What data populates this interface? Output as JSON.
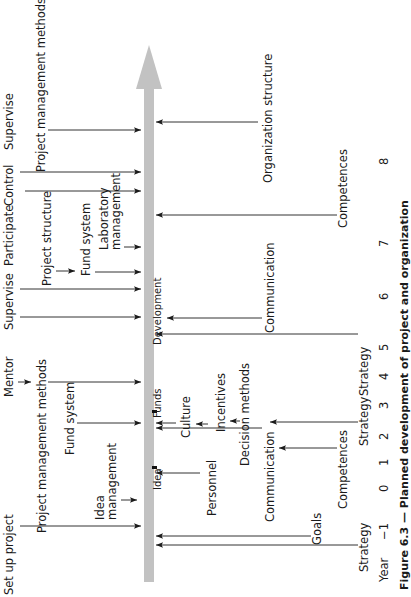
{
  "diagram": {
    "axis": {
      "label": "Year",
      "ticks": [
        "−1",
        "0",
        "1",
        "2",
        "3",
        "4",
        "5",
        "6",
        "7",
        "8"
      ],
      "tick_x": 378,
      "tick_y": [
        540,
        492,
        466,
        440,
        409,
        380,
        351,
        300,
        247,
        165
      ],
      "label_pos": {
        "x": 378,
        "y": 582
      }
    },
    "main_arrow": {
      "color": "#c2c2c2",
      "x": 144,
      "width": 10,
      "y_top": 45,
      "y_bottom": 582,
      "head_height": 44,
      "head_width": 26
    },
    "left_roles": [
      {
        "label": "Set up project",
        "x": 3,
        "y": 595
      },
      {
        "label": "Mentor",
        "x": 3,
        "y": 397
      },
      {
        "label": "Supervise",
        "x": 3,
        "y": 330
      },
      {
        "label": "Participate",
        "x": 3,
        "y": 266
      },
      {
        "label": "Control",
        "x": 3,
        "y": 206
      },
      {
        "label": "Supervise",
        "x": 3,
        "y": 150
      }
    ],
    "left_labels": [
      {
        "label": "Project management methods",
        "x": 36,
        "y": 533
      },
      {
        "label": "Fund system",
        "x": 64,
        "y": 455
      },
      {
        "label": "Idea",
        "x": 94,
        "y": 520,
        "line2": "management"
      },
      {
        "label": "Project structure",
        "x": 41,
        "y": 286
      },
      {
        "label": "Fund system",
        "x": 80,
        "y": 276
      },
      {
        "label": "Laboratory",
        "x": 98,
        "y": 250,
        "line2": "management"
      },
      {
        "label": "Project management methods",
        "x": 35,
        "y": 172
      }
    ],
    "right_labels": [
      {
        "label": "Development",
        "x": 152,
        "y": 345,
        "small": true
      },
      {
        "label": "Funds",
        "x": 152,
        "y": 418,
        "small": true
      },
      {
        "label": "Idea",
        "x": 152,
        "y": 490,
        "small": true
      },
      {
        "label": "Culture",
        "x": 180,
        "y": 438
      },
      {
        "label": "Incentives",
        "x": 215,
        "y": 432
      },
      {
        "label": "Decision methods",
        "x": 239,
        "y": 466
      },
      {
        "label": "Personnel",
        "x": 206,
        "y": 516
      },
      {
        "label": "Communication",
        "x": 264,
        "y": 522
      },
      {
        "label": "Communication",
        "x": 264,
        "y": 333
      },
      {
        "label": "Competences",
        "x": 337,
        "y": 509
      },
      {
        "label": "Goals",
        "x": 311,
        "y": 545
      },
      {
        "label": "Strategy",
        "x": 358,
        "y": 572
      },
      {
        "label": "Strategy",
        "x": 358,
        "y": 446
      },
      {
        "label": "Strategy",
        "x": 358,
        "y": 396
      },
      {
        "label": "Competences",
        "x": 337,
        "y": 228
      },
      {
        "label": "Organization structure",
        "x": 262,
        "y": 183
      }
    ],
    "left_arrows": [
      {
        "from_x": 20,
        "to_x": 141,
        "y": 526,
        "name": "set-up-project-arrow"
      },
      {
        "from_x": 121,
        "to_x": 137,
        "y": 500,
        "name": "idea-management-arrow"
      },
      {
        "from_x": 77,
        "to_x": 141,
        "y": 423,
        "name": "fund-system-arrow"
      },
      {
        "from_x": 48,
        "to_x": 141,
        "y": 382,
        "name": "pm-methods-arrow"
      },
      {
        "from_x": 18,
        "to_x": 31,
        "y": 382,
        "name": "mentor-arrow"
      },
      {
        "from_x": 20,
        "to_x": 141,
        "y": 317,
        "name": "supervise-arrow-1"
      },
      {
        "from_x": 20,
        "to_x": 141,
        "y": 289,
        "name": "participate-arrow"
      },
      {
        "from_x": 56,
        "to_x": 75,
        "y": 271,
        "name": "project-structure-arrow"
      },
      {
        "from_x": 95,
        "to_x": 141,
        "y": 272,
        "name": "fund-system-2-arrow"
      },
      {
        "from_x": 124,
        "to_x": 141,
        "y": 247,
        "name": "lab-management-arrow"
      },
      {
        "from_x": 25,
        "to_x": 141,
        "y": 191,
        "name": "control-arrow"
      },
      {
        "from_x": 20,
        "to_x": 141,
        "y": 172,
        "name": "supervise-arrow-2"
      },
      {
        "from_x": 48,
        "to_x": 141,
        "y": 130,
        "name": "pm-methods-2-arrow"
      }
    ],
    "right_arrows": [
      {
        "from_x": 358,
        "to_x": 156,
        "y": 545,
        "name": "strategy-arrow-1"
      },
      {
        "from_x": 311,
        "to_x": 156,
        "y": 536,
        "name": "goals-arrow"
      },
      {
        "from_x": 200,
        "to_x": 156,
        "y": 473,
        "name": "personnel-arrow"
      },
      {
        "from_x": 262,
        "to_x": 156,
        "y": 428,
        "name": "communication-arrow-1"
      },
      {
        "from_x": 337,
        "to_x": 279,
        "y": 448,
        "name": "competences-arrow-1"
      },
      {
        "from_x": 358,
        "to_x": 270,
        "y": 422,
        "name": "strategy-arrow-2"
      },
      {
        "from_x": 176,
        "to_x": 156,
        "y": 423,
        "name": "culture-arrow"
      },
      {
        "from_x": 208,
        "to_x": 196,
        "y": 424,
        "name": "incentives-arrow"
      },
      {
        "from_x": 240,
        "to_x": 230,
        "y": 421,
        "name": "decision-arrow"
      },
      {
        "from_x": 358,
        "to_x": 156,
        "y": 334,
        "name": "strategy-arrow-3"
      },
      {
        "from_x": 262,
        "to_x": 167,
        "y": 318,
        "name": "communication-arrow-2"
      },
      {
        "from_x": 337,
        "to_x": 156,
        "y": 215,
        "name": "competences-arrow-2"
      },
      {
        "from_x": 258,
        "to_x": 156,
        "y": 122,
        "name": "organization-structure-arrow"
      }
    ],
    "milestones": [
      {
        "name": "funds-marker",
        "x": 152,
        "y": 410
      },
      {
        "name": "idea-marker",
        "x": 152,
        "y": 466
      }
    ],
    "caption": {
      "text": "Figure 6.3 — Planned development of project and organization",
      "x": 398,
      "y": 590
    }
  }
}
